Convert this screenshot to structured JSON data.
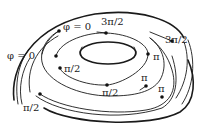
{
  "diagram": {
    "type": "torus-phase-curves",
    "colors": {
      "stroke": "#1a1a1a",
      "dot": "#111111",
      "text": "#222222",
      "background": "#ffffff"
    },
    "labels": [
      {
        "id": "phi0-top",
        "text": "φ = 0",
        "x": 63,
        "y": 22
      },
      {
        "id": "3pi2-top",
        "text": "3π/2",
        "x": 101,
        "y": 17
      },
      {
        "id": "3pi2-right",
        "text": "3π/2",
        "x": 165,
        "y": 35
      },
      {
        "id": "pi-right-upper",
        "text": "π",
        "x": 153,
        "y": 52
      },
      {
        "id": "phi0-left",
        "text": "φ = 0",
        "x": 7,
        "y": 51
      },
      {
        "id": "pi2-mid-left",
        "text": "π/2",
        "x": 64,
        "y": 64
      },
      {
        "id": "pi-right-mid",
        "text": "π",
        "x": 141,
        "y": 73
      },
      {
        "id": "pi2-bottom-mid",
        "text": "π/2",
        "x": 102,
        "y": 88
      },
      {
        "id": "pi2-bottom-left",
        "text": "π/2",
        "x": 23,
        "y": 103
      },
      {
        "id": "pi-right-lower",
        "text": "π",
        "x": 158,
        "y": 84
      }
    ],
    "points": [
      {
        "id": "dot-phi0-top",
        "x": 59,
        "y": 31
      },
      {
        "id": "dot-3pi2-top",
        "x": 106,
        "y": 33
      },
      {
        "id": "dot-3pi2-right",
        "x": 172,
        "y": 41
      },
      {
        "id": "dot-pi-right-upper",
        "x": 148,
        "y": 54
      },
      {
        "id": "dot-phi0-left",
        "x": 56,
        "y": 56
      },
      {
        "id": "dot-pi2-mid-left",
        "x": 60,
        "y": 68
      },
      {
        "id": "dot-pi-right-mid",
        "x": 146,
        "y": 86
      },
      {
        "id": "dot-pi2-bottom-mid",
        "x": 107,
        "y": 85
      },
      {
        "id": "dot-pi2-bottom-left",
        "x": 40,
        "y": 94
      },
      {
        "id": "dot-pi-right-lower",
        "x": 162,
        "y": 97
      }
    ]
  }
}
